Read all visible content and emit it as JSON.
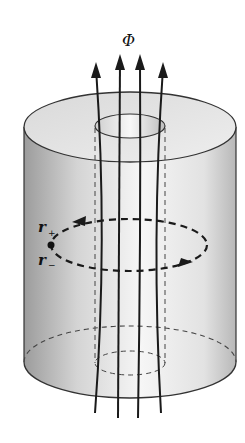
{
  "diagram": {
    "flux_label": "Φ",
    "loop_labels": {
      "r_plus_base": "r",
      "r_plus_sub": "+",
      "r_minus_base": "r",
      "r_minus_sub": "−"
    },
    "colors": {
      "stroke": "#222222",
      "cylinder_shade_dark": "#9a9a9a",
      "cylinder_shade_light": "#f4f4f4",
      "top_face": "#e6e6e6",
      "background": "#ffffff"
    },
    "elements": [
      "hollow cylinder (annulus cross-section)",
      "inner hole (dashed through body)",
      "four magnetic flux lines with upward arrows",
      "dashed circulation loop with direction arrows",
      "point on loop labelled r+ / r-"
    ]
  }
}
